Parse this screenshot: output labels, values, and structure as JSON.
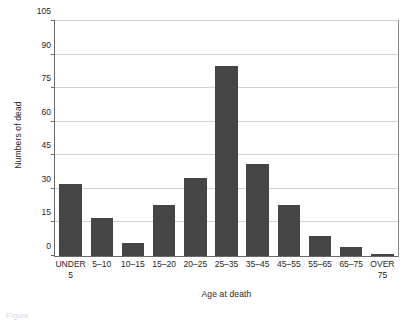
{
  "chart_data": {
    "type": "bar",
    "title": "",
    "xlabel": "Age at death",
    "ylabel": "Numbers of dead",
    "categories": [
      "UNDER\n5",
      "5–10",
      "10–15",
      "15–20",
      "20–25",
      "25–35",
      "35–45",
      "45–55",
      "55–65",
      "65–75",
      "OVER\n75"
    ],
    "values": [
      32,
      17,
      6,
      23,
      35,
      85,
      41,
      23,
      9,
      4,
      1
    ],
    "ylim": [
      0,
      105
    ],
    "yticks": [
      0,
      15,
      30,
      45,
      60,
      75,
      90,
      105
    ],
    "ytick_labels": [
      "0",
      "15",
      "30",
      "45",
      "60",
      "75",
      "90",
      "105"
    ],
    "grid": true,
    "legend": false,
    "bar_color": "#454545",
    "grid_color": "#d2d2d2",
    "frame_color": "#6a6a6a"
  },
  "caption": "Figure"
}
